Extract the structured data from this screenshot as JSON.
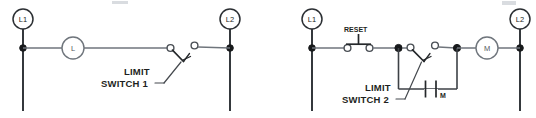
{
  "document": {
    "kind": "electrical-ladder-diagram",
    "panel_count": 2,
    "background_color": "#ffffff",
    "line_color": "#3d4146",
    "ink_color": "#1d1f21"
  },
  "diagram_left": {
    "title": "Limit switch controlling a lamp",
    "power_rail_left": {
      "label": "L1"
    },
    "power_rail_right": {
      "label": "L2"
    },
    "load": {
      "label": "L",
      "type": "lamp"
    },
    "switch": {
      "type": "normally-open-limit-switch",
      "callout_line_1": "LIMIT",
      "callout_line_2": "SWITCH 1"
    }
  },
  "diagram_right": {
    "title": "Limit switch with motor starter and holding contact",
    "power_rail_left": {
      "label": "L1"
    },
    "power_rail_right": {
      "label": "L2"
    },
    "reset": {
      "label": "RESET",
      "type": "normally-closed-pushbutton"
    },
    "load": {
      "label": "M",
      "type": "motor-starter-coil"
    },
    "switch": {
      "type": "normally-open-limit-switch",
      "callout_line_1": "LIMIT",
      "callout_line_2": "SWITCH 2"
    },
    "holding_contact": {
      "label": "M",
      "type": "normally-open-auxiliary-contact"
    }
  }
}
